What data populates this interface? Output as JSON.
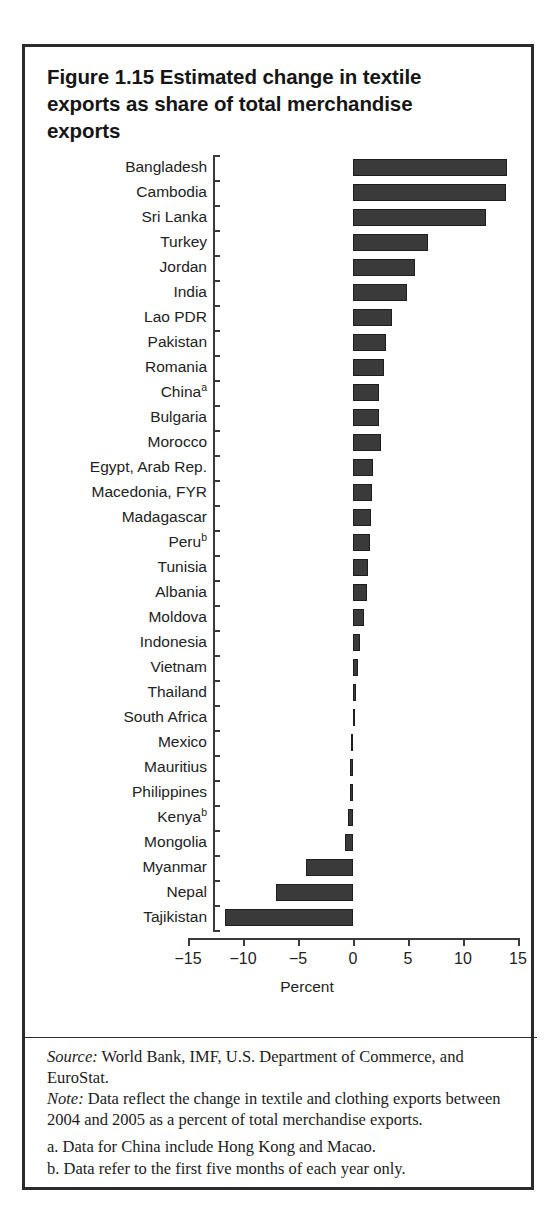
{
  "figure": {
    "title": "Figure 1.15  Estimated change in textile exports as share of total merchandise exports"
  },
  "chart_data": {
    "type": "bar",
    "orientation": "horizontal",
    "title": "Figure 1.15  Estimated change in textile exports as share of total merchandise exports",
    "xlabel": "Percent",
    "ylabel": "",
    "xlim": [
      -15,
      15
    ],
    "xticks": [
      -15,
      -10,
      -5,
      0,
      5,
      10,
      15
    ],
    "xtick_labels": [
      "−15",
      "−10",
      "−5",
      "0",
      "5",
      "10",
      "15"
    ],
    "grid": false,
    "legend": false,
    "bar_color": "#3a3a3a",
    "categories": [
      "Bangladesh",
      "Cambodia",
      "Sri Lanka",
      "Turkey",
      "Jordan",
      "India",
      "Lao PDR",
      "Pakistan",
      "Romania",
      "China",
      "Bulgaria",
      "Morocco",
      "Egypt, Arab Rep.",
      "Macedonia, FYR",
      "Madagascar",
      "Peru",
      "Tunisia",
      "Albania",
      "Moldova",
      "Indonesia",
      "Vietnam",
      "Thailand",
      "South Africa",
      "Mexico",
      "Mauritius",
      "Philippines",
      "Kenya",
      "Mongolia",
      "Myanmar",
      "Nepal",
      "Tajikistan"
    ],
    "category_footnote_marks": {
      "China": "a",
      "Peru": "b",
      "Kenya": "b"
    },
    "values": [
      14.0,
      13.9,
      12.1,
      6.8,
      5.6,
      4.9,
      3.5,
      3.0,
      2.8,
      2.4,
      2.4,
      2.5,
      1.8,
      1.7,
      1.6,
      1.5,
      1.4,
      1.3,
      1.0,
      0.6,
      0.45,
      0.3,
      0.05,
      -0.2,
      -0.25,
      -0.3,
      -0.5,
      -0.7,
      -4.3,
      -7.0,
      -11.6
    ]
  },
  "footnotes": {
    "source_label": "Source:",
    "source_text": " World Bank, IMF, U.S. Department of Commerce, and EuroStat.",
    "note_label": "Note:",
    "note_text": " Data reflect the change in textile and clothing exports between 2004 and 2005 as a percent of total merchandise exports.",
    "note_a": "a. Data for China include Hong Kong and Macao.",
    "note_b": "b. Data refer to the first five months of each year only."
  }
}
